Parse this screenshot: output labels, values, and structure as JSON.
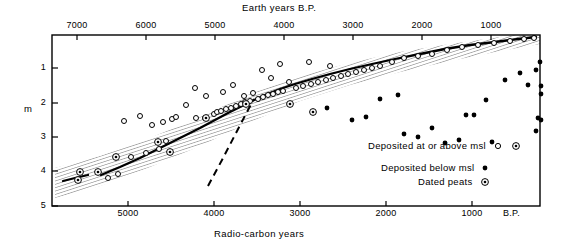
{
  "chart_data": {
    "type": "scatter",
    "title": "",
    "top_axis": {
      "label": "Earth years B.P.",
      "ticks": [
        7000,
        6000,
        5000,
        4000,
        3000,
        2000,
        1000
      ],
      "tick_labels": [
        "7000",
        "6000",
        "5000",
        "4000",
        "3000",
        "2000",
        "1000"
      ],
      "tick_x": [
        77,
        146,
        215,
        284,
        353,
        422,
        491
      ]
    },
    "bottom_axis": {
      "label": "Radio-carbon years",
      "unit_label": "B.P.",
      "ticks": [
        5000,
        4000,
        3000,
        2000,
        1000
      ],
      "tick_labels": [
        "5000",
        "4000",
        "3000",
        "2000",
        "1000"
      ],
      "tick_x": [
        128,
        214,
        300,
        386,
        472
      ],
      "unit_x": 515
    },
    "y_axis": {
      "label": "m",
      "ticks": [
        1,
        2,
        3,
        4,
        5
      ],
      "tick_labels": [
        "1",
        "2",
        "3",
        "4",
        "5"
      ],
      "tick_y": [
        68,
        103,
        137,
        171,
        206
      ],
      "direction": "inverted-depth"
    },
    "plot_box": {
      "left": 52,
      "right": 540,
      "top": 35,
      "bottom": 206
    },
    "legend": {
      "position": "inside-lower-right",
      "entries": [
        {
          "label": "Deposited at or above msl",
          "marker": "open-circle-and-circled-dot"
        },
        {
          "label": "Deposited below msl",
          "marker": "filled-circle"
        },
        {
          "label": "Dated peats",
          "marker": "circled-dot"
        }
      ]
    },
    "series": [
      {
        "name": "Deposited at or above msl",
        "marker": "open-circle",
        "points": [
          [
            108,
            178
          ],
          [
            118,
            174
          ],
          [
            131,
            157
          ],
          [
            146,
            153
          ],
          [
            159,
            149
          ],
          [
            166,
            141
          ],
          [
            124,
            121
          ],
          [
            140,
            116
          ],
          [
            152,
            125
          ],
          [
            163,
            122
          ],
          [
            172,
            119
          ],
          [
            176,
            117
          ],
          [
            186,
            105
          ],
          [
            196,
            118
          ],
          [
            205,
            118
          ],
          [
            214,
            114
          ],
          [
            217,
            112
          ],
          [
            221,
            111
          ],
          [
            226,
            109
          ],
          [
            231,
            108
          ],
          [
            236,
            106
          ],
          [
            241,
            104
          ],
          [
            245,
            102
          ],
          [
            250,
            101
          ],
          [
            195,
            88
          ],
          [
            206,
            96
          ],
          [
            223,
            92
          ],
          [
            233,
            85
          ],
          [
            244,
            96
          ],
          [
            253,
            93
          ],
          [
            258,
            99
          ],
          [
            263,
            97
          ],
          [
            268,
            95
          ],
          [
            273,
            94
          ],
          [
            278,
            92
          ],
          [
            283,
            91
          ],
          [
            262,
            70
          ],
          [
            271,
            78
          ],
          [
            280,
            64
          ],
          [
            289,
            82
          ],
          [
            296,
            88
          ],
          [
            303,
            86
          ],
          [
            311,
            84
          ],
          [
            318,
            82
          ],
          [
            326,
            80
          ],
          [
            333,
            78
          ],
          [
            341,
            76
          ],
          [
            348,
            74
          ],
          [
            309,
            62
          ],
          [
            330,
            66
          ],
          [
            356,
            72
          ],
          [
            364,
            70
          ],
          [
            372,
            68
          ],
          [
            380,
            66
          ],
          [
            392,
            62
          ],
          [
            404,
            58
          ],
          [
            418,
            56
          ],
          [
            432,
            54
          ],
          [
            447,
            50
          ],
          [
            462,
            47
          ],
          [
            478,
            45
          ],
          [
            494,
            43
          ],
          [
            510,
            41
          ],
          [
            524,
            39
          ],
          [
            534,
            38
          ]
        ]
      },
      {
        "name": "Deposited below msl",
        "marker": "filled-circle",
        "points": [
          [
            327,
            108
          ],
          [
            352,
            120
          ],
          [
            366,
            117
          ],
          [
            380,
            99
          ],
          [
            398,
            95
          ],
          [
            404,
            134
          ],
          [
            418,
            137
          ],
          [
            432,
            128
          ],
          [
            445,
            143
          ],
          [
            459,
            140
          ],
          [
            466,
            115
          ],
          [
            474,
            115
          ],
          [
            486,
            100
          ],
          [
            492,
            142
          ],
          [
            505,
            80
          ],
          [
            520,
            73
          ],
          [
            528,
            85
          ],
          [
            536,
            70
          ],
          [
            540,
            62
          ],
          [
            541,
            86
          ],
          [
            541,
            94
          ],
          [
            538,
            118
          ],
          [
            541,
            120
          ],
          [
            536,
            131
          ]
        ]
      },
      {
        "name": "Dated peats",
        "marker": "circled-dot",
        "points": [
          [
            78,
            180
          ],
          [
            80,
            172
          ],
          [
            98,
            172
          ],
          [
            116,
            157
          ],
          [
            158,
            142
          ],
          [
            170,
            152
          ],
          [
            206,
            118
          ],
          [
            246,
            104
          ],
          [
            290,
            104
          ],
          [
            313,
            112
          ]
        ]
      }
    ],
    "sea_level_curve": {
      "name": "mean sea-level curve",
      "style": "solid",
      "segments": [
        [
          [
            63,
            181
          ],
          [
            75,
            178
          ],
          [
            88,
            175
          ]
        ],
        [
          [
            101,
            175
          ],
          [
            120,
            167
          ],
          [
            140,
            158
          ],
          [
            160,
            148
          ],
          [
            180,
            138
          ],
          [
            200,
            128
          ],
          [
            215,
            120
          ],
          [
            228,
            113
          ],
          [
            240,
            107
          ],
          [
            252,
            101
          ],
          [
            265,
            95
          ],
          [
            280,
            89
          ],
          [
            295,
            84
          ],
          [
            312,
            79
          ],
          [
            330,
            74
          ],
          [
            350,
            69
          ],
          [
            372,
            64
          ],
          [
            395,
            59
          ],
          [
            420,
            54
          ],
          [
            445,
            49
          ],
          [
            470,
            45
          ],
          [
            495,
            42
          ],
          [
            518,
            39
          ],
          [
            536,
            37
          ]
        ]
      ]
    },
    "alternative_curve": {
      "name": "alternative interpretation",
      "style": "dashed",
      "points": [
        [
          208,
          186
        ],
        [
          222,
          160
        ],
        [
          236,
          133
        ],
        [
          248,
          110
        ],
        [
          254,
          99
        ]
      ]
    },
    "uncertainty_band": {
      "name": "error envelope",
      "style": "hatched",
      "upper": [
        [
          55,
          168
        ],
        [
          100,
          156
        ],
        [
          150,
          138
        ],
        [
          200,
          117
        ],
        [
          250,
          94
        ],
        [
          300,
          76
        ],
        [
          350,
          63
        ],
        [
          400,
          52
        ],
        [
          450,
          44
        ],
        [
          500,
          37
        ],
        [
          540,
          32
        ]
      ],
      "lower": [
        [
          55,
          198
        ],
        [
          100,
          186
        ],
        [
          150,
          167
        ],
        [
          200,
          146
        ],
        [
          250,
          122
        ],
        [
          300,
          101
        ],
        [
          350,
          85
        ],
        [
          400,
          72
        ],
        [
          450,
          61
        ],
        [
          500,
          51
        ],
        [
          540,
          44
        ]
      ]
    },
    "grid": false
  }
}
